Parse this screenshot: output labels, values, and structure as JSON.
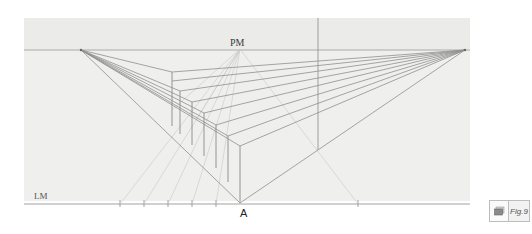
{
  "figure": {
    "labels": {
      "measuring_point": "PM",
      "ground_line": "LM",
      "point_a": "A"
    },
    "badge": {
      "icon": "copy-icon",
      "label": "Fig.9"
    },
    "colors": {
      "paper": "#efefee",
      "line": "#8a8a8a",
      "construction_line": "#c4c4c4",
      "text": "#3a3a3a"
    },
    "geometry": {
      "horizon_y": 50,
      "ground_line_y": 204,
      "vanishing_point_left": [
        81,
        50
      ],
      "vanishing_point_right": [
        465,
        50
      ],
      "measuring_point": [
        240,
        49
      ],
      "point_a": [
        240,
        203
      ],
      "ground_ticks_x": [
        120,
        144,
        168,
        192,
        216,
        358
      ]
    }
  }
}
